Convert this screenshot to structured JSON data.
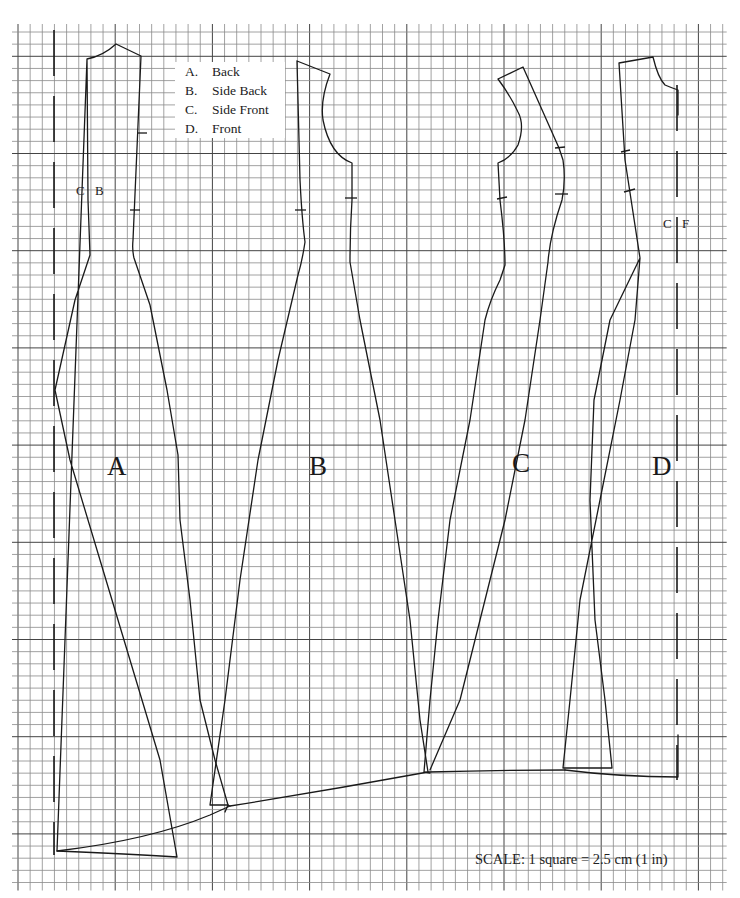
{
  "legend": {
    "items": [
      {
        "key": "A.",
        "label": "Back"
      },
      {
        "key": "B.",
        "label": "Side Back"
      },
      {
        "key": "C.",
        "label": "Side Front"
      },
      {
        "key": "D.",
        "label": "Front"
      }
    ]
  },
  "pieces": [
    {
      "id": "A",
      "letter": "A",
      "name": "Back"
    },
    {
      "id": "B",
      "letter": "B",
      "name": "Side Back"
    },
    {
      "id": "C",
      "letter": "C",
      "name": "Side Front"
    },
    {
      "id": "D",
      "letter": "D",
      "name": "Front"
    }
  ],
  "fold_labels": {
    "center_back": {
      "left": "C",
      "right": "B"
    },
    "center_front": {
      "left": "C",
      "right": "F"
    }
  },
  "scale": {
    "text": "SCALE:  1 square = 2.5 cm (1 in)"
  },
  "grid": {
    "square_size_cm": 2.5,
    "square_size_in": 1,
    "line_color": "#8a8a8a",
    "major_line_color": "#444444"
  },
  "colors": {
    "ink": "#1a1a1a",
    "paper": "#ffffff"
  }
}
